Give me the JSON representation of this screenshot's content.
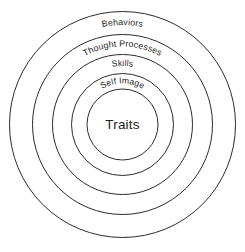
{
  "diagram": {
    "background_color": "#ffffff",
    "stroke_color": "#2b2b2b",
    "text_color": "#1e1e1e",
    "center": {
      "x": 122.5,
      "y": 124.5
    },
    "rings": [
      {
        "label": "Behaviors",
        "radius": 113,
        "label_radius": 99.5,
        "index": 0
      },
      {
        "label": "Thought Processes",
        "radius": 90,
        "label_radius": 78.0,
        "index": 1
      },
      {
        "label": "Skills",
        "radius": 70,
        "label_radius": 58.5,
        "index": 2
      },
      {
        "label": "Self Image",
        "radius": 51,
        "label_radius": 41.0,
        "index": 3
      }
    ],
    "core": {
      "label": "Traits",
      "radius": 35.5
    }
  },
  "chart_data": {
    "type": "pie",
    "categories": [
      "Behaviors",
      "Thought Processes",
      "Skills",
      "Self Image",
      "Traits"
    ],
    "values": [
      113,
      90,
      70,
      51,
      35.5
    ],
    "xlabel": "",
    "ylabel": "Radius (px)",
    "legend": "none",
    "grid": false
  }
}
